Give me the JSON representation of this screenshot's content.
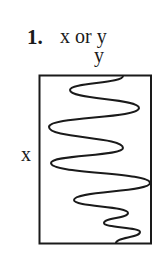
{
  "figure": {
    "number": "1.",
    "title": "x or y",
    "y_axis_label": "y",
    "x_axis_label": "x"
  },
  "plot": {
    "box": {
      "x": 39.5,
      "y": 75.5,
      "width": 111.5,
      "height": 168
    },
    "stroke_color": "#1a1a1a",
    "curve_points": [
      [
        123,
        76
      ],
      [
        70,
        90
      ],
      [
        139,
        108
      ],
      [
        49,
        127
      ],
      [
        123,
        148
      ],
      [
        51,
        163
      ],
      [
        150,
        183
      ],
      [
        74,
        200
      ],
      [
        128,
        213
      ],
      [
        104,
        223
      ],
      [
        140,
        232
      ],
      [
        116,
        243
      ]
    ]
  }
}
